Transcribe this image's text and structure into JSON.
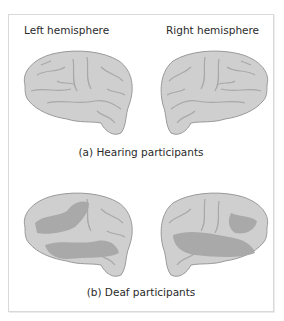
{
  "figure": {
    "column_labels": {
      "left": "Left hemisphere",
      "right": "Right hemisphere"
    },
    "panels": [
      {
        "caption": "(a) Hearing participants",
        "highlighted": false
      },
      {
        "caption": "(b) Deaf participants",
        "highlighted": true
      }
    ],
    "colors": {
      "brain_surface": "#cfcfcf",
      "brain_outline": "#9a9a9a",
      "sulci": "#a8a8a8",
      "activation": "#a9a9a9",
      "border": "#d9d9d9"
    }
  }
}
